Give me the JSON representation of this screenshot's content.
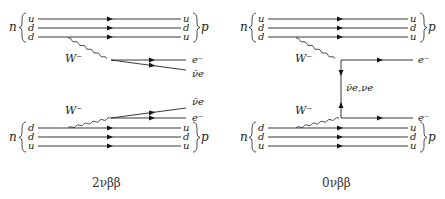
{
  "diagrams": [
    {
      "caption": "2νββ",
      "top_nucleon": {
        "in": "n",
        "out": "p",
        "in_quarks": [
          "u",
          "d",
          "d"
        ],
        "out_quarks": [
          "u",
          "d",
          "u"
        ]
      },
      "bottom_nucleon": {
        "in": "n",
        "out": "p",
        "in_quarks": [
          "d",
          "d",
          "u"
        ],
        "out_quarks": [
          "u",
          "d",
          "u"
        ]
      },
      "boson_top": "W⁻",
      "boson_bottom": "W⁻",
      "leptons_top": [
        "e⁻",
        "ν̄e"
      ],
      "leptons_bottom": [
        "ν̄e",
        "e⁻"
      ]
    },
    {
      "caption": "0νββ",
      "top_nucleon": {
        "in": "n",
        "out": "p",
        "in_quarks": [
          "u",
          "d",
          "d"
        ],
        "out_quarks": [
          "u",
          "d",
          "u"
        ]
      },
      "bottom_nucleon": {
        "in": "n",
        "out": "p",
        "in_quarks": [
          "d",
          "d",
          "u"
        ],
        "out_quarks": [
          "u",
          "d",
          "u"
        ]
      },
      "boson_top": "W⁻",
      "boson_bottom": "W⁻",
      "leptons_top": [
        "e⁻"
      ],
      "leptons_bottom": [
        "e⁻"
      ],
      "internal_line": "ν̄e,νe"
    }
  ],
  "colors": {
    "line": "#222222",
    "text": "#222222"
  }
}
